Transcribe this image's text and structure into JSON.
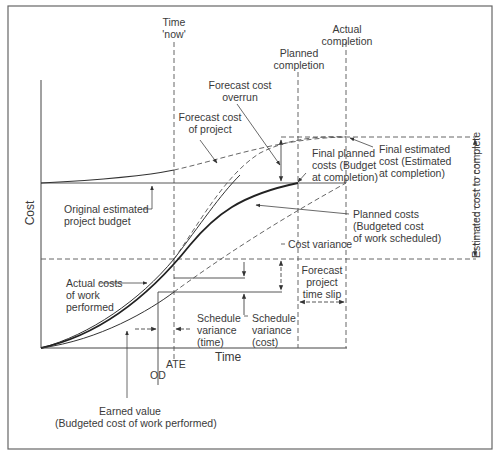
{
  "diagram": {
    "type": "earned value S-curve diagram",
    "axes": {
      "y_label": "Cost",
      "x_label": "Time"
    },
    "markers": {
      "time_now": "Time\n'now'",
      "time_now_l1": "Time",
      "time_now_l2": "'now'",
      "planned_completion_l1": "Planned",
      "planned_completion_l2": "completion",
      "actual_completion_l1": "Actual",
      "actual_completion_l2": "completion",
      "ate": "ATE",
      "od": "OD"
    },
    "labels": {
      "forecast_cost_overrun_l1": "Forecast cost",
      "forecast_cost_overrun_l2": "overrun",
      "forecast_cost_project_l1": "Forecast cost",
      "forecast_cost_project_l2": "of project",
      "original_budget_l1": "Original estimated",
      "original_budget_l2": "project budget",
      "final_planned_l1": "Final planned",
      "final_planned_l2": "costs (Budget",
      "final_planned_l3": "at completion)",
      "final_estimated_l1": "Final estimated",
      "final_estimated_l2": "cost (Estimated",
      "final_estimated_l3": "at completion)",
      "planned_costs_l1": "Planned costs",
      "planned_costs_l2": "(Budgeted cost",
      "planned_costs_l3": "of work scheduled)",
      "cost_variance": "Cost variance",
      "actual_costs_l1": "Actual costs",
      "actual_costs_l2": "of work",
      "actual_costs_l3": "performed",
      "schedule_var_time_l1": "Schedule",
      "schedule_var_time_l2": "variance",
      "schedule_var_time_l3": "(time)",
      "schedule_var_cost_l1": "Schedule",
      "schedule_var_cost_l2": "variance",
      "schedule_var_cost_l3": "(cost)",
      "forecast_slip_l1": "Forecast",
      "forecast_slip_l2": "project",
      "forecast_slip_l3": "time slip",
      "earned_value_l1": "Earned value",
      "earned_value_l2": "(Budgeted cost of work performed)",
      "estimated_cost_to_complete": "Estimated cost to complete"
    },
    "curves": [
      {
        "name": "Actual costs of work performed",
        "style": "thin solid"
      },
      {
        "name": "Planned costs (Budgeted cost of work scheduled)",
        "style": "thick solid"
      },
      {
        "name": "Earned value (Budgeted cost of work performed)",
        "style": "thin solid"
      },
      {
        "name": "Forecast cost of project",
        "style": "dashed"
      },
      {
        "name": "Forecast actual cost continuation",
        "style": "dashed"
      },
      {
        "name": "Forecast earned value continuation",
        "style": "dashed"
      }
    ],
    "colors": {
      "line": "#333333",
      "frame": "#555555",
      "background": "#ffffff"
    }
  }
}
